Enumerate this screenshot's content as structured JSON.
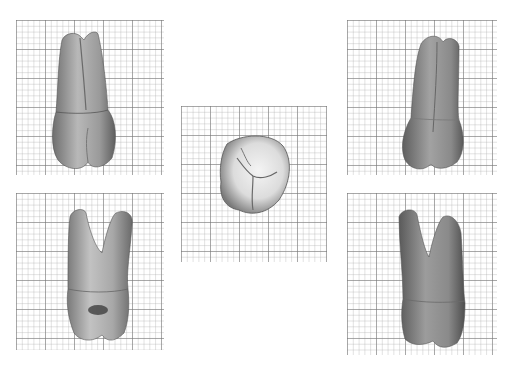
{
  "figure": {
    "background": "#ffffff",
    "grid": {
      "major_color": "#8a8a8a",
      "minor_color": "#c4c4c4",
      "major_spacing_px": 29,
      "minor_per_major": 5
    },
    "panels": [
      {
        "id": "p1",
        "view": "buccal-view-crown-down",
        "x": 16,
        "y": 20,
        "w": 148,
        "h": 155
      },
      {
        "id": "p2",
        "view": "lingual-view-crown-down",
        "x": 16,
        "y": 193,
        "w": 148,
        "h": 157
      },
      {
        "id": "p3",
        "view": "occlusal-view",
        "x": 181,
        "y": 106,
        "w": 146,
        "h": 156
      },
      {
        "id": "p4",
        "view": "mesial-view-crown-down",
        "x": 347,
        "y": 20,
        "w": 150,
        "h": 155
      },
      {
        "id": "p5",
        "view": "distal-view-crown-down",
        "x": 347,
        "y": 193,
        "w": 150,
        "h": 162
      }
    ]
  }
}
